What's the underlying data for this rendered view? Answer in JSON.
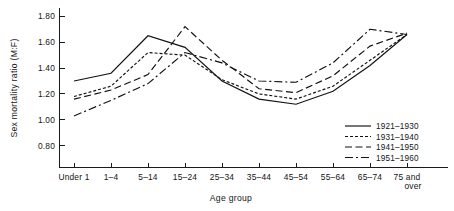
{
  "chart_data": {
    "type": "line",
    "title": "",
    "xlabel": "Age group",
    "ylabel": "Sex mortality ratio (M:F)",
    "categories": [
      "Under 1",
      "1–4",
      "5–14",
      "15–24",
      "25–34",
      "35–44",
      "45–54",
      "55–64",
      "65–74",
      "75 and over"
    ],
    "category_lines": [
      [
        "Under 1"
      ],
      [
        "1–4"
      ],
      [
        "5–14"
      ],
      [
        "15–24"
      ],
      [
        "25–34"
      ],
      [
        "35–44"
      ],
      [
        "45–54"
      ],
      [
        "55–64"
      ],
      [
        "65–74"
      ],
      [
        "75 and",
        "over"
      ]
    ],
    "ylim": [
      0.72,
      1.88
    ],
    "yticks": [
      0.8,
      1.0,
      1.2,
      1.4,
      1.6,
      1.8
    ],
    "ytick_labels": [
      "0.80",
      "1.00",
      "1.20",
      "1.40",
      "1.60",
      "1.80"
    ],
    "grid": false,
    "legend_position": "bottom-right",
    "series": [
      {
        "name": "1921–1930",
        "dash": "none",
        "values": [
          1.3,
          1.36,
          1.65,
          1.56,
          1.3,
          1.16,
          1.12,
          1.22,
          1.42,
          1.66
        ]
      },
      {
        "name": "1931–1940",
        "dash": "dotted",
        "values": [
          1.18,
          1.26,
          1.52,
          1.5,
          1.31,
          1.2,
          1.16,
          1.26,
          1.46,
          1.66
        ]
      },
      {
        "name": "1941–1950",
        "dash": "dashed",
        "values": [
          1.16,
          1.23,
          1.35,
          1.72,
          1.46,
          1.24,
          1.21,
          1.34,
          1.57,
          1.67
        ]
      },
      {
        "name": "1951–1960",
        "dash": "dashdot",
        "values": [
          1.03,
          1.15,
          1.28,
          1.52,
          1.44,
          1.3,
          1.29,
          1.44,
          1.7,
          1.66
        ]
      }
    ]
  },
  "colors": {
    "ink": "#111111",
    "background": "#ffffff"
  }
}
